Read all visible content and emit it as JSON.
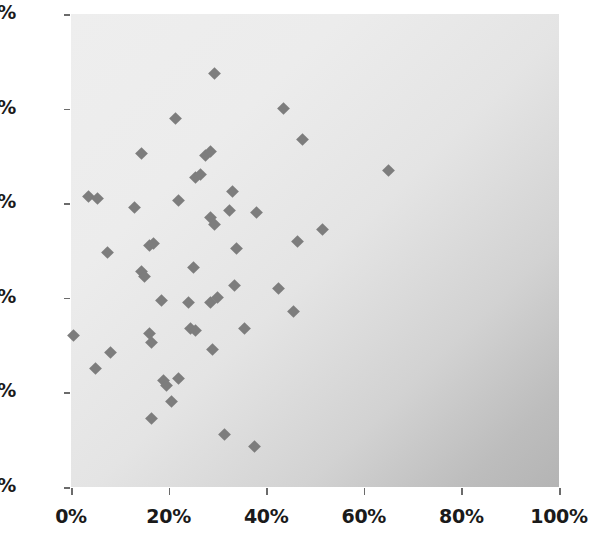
{
  "chart_data": {
    "type": "scatter",
    "title": "",
    "xlabel": "",
    "ylabel": "",
    "xlim": [
      0,
      100
    ],
    "ylim": [
      0,
      100
    ],
    "grid": false,
    "legend": null,
    "marker": {
      "shape": "diamond",
      "color": "#7d7d7d",
      "size_px": 9
    },
    "plot_background": {
      "type": "diagonal-gradient",
      "from": "#eeeeee",
      "to": "#b4b4b4",
      "direction": "top-left to bottom-right"
    },
    "xticks": [
      0,
      20,
      40,
      60,
      80,
      100
    ],
    "yticks": [
      0,
      20,
      40,
      60,
      80,
      100
    ],
    "xtick_labels": [
      "0%",
      "20%",
      "40%",
      "60%",
      "80%",
      "100%"
    ],
    "ytick_labels": [
      "0%",
      "20%",
      "40%",
      "60%",
      "80%",
      "100%"
    ],
    "units": "percent",
    "n_points": 51,
    "points": [
      {
        "x": 0.5,
        "y": 32.0
      },
      {
        "x": 3.5,
        "y": 61.5
      },
      {
        "x": 5.5,
        "y": 61.0
      },
      {
        "x": 5.0,
        "y": 25.0
      },
      {
        "x": 7.5,
        "y": 49.5
      },
      {
        "x": 8.0,
        "y": 28.5
      },
      {
        "x": 13.0,
        "y": 59.0
      },
      {
        "x": 14.5,
        "y": 70.5
      },
      {
        "x": 14.5,
        "y": 45.5
      },
      {
        "x": 15.0,
        "y": 44.5
      },
      {
        "x": 16.0,
        "y": 51.0
      },
      {
        "x": 17.0,
        "y": 51.5
      },
      {
        "x": 16.0,
        "y": 32.5
      },
      {
        "x": 16.5,
        "y": 30.5
      },
      {
        "x": 16.5,
        "y": 14.5
      },
      {
        "x": 18.5,
        "y": 39.5
      },
      {
        "x": 19.0,
        "y": 22.5
      },
      {
        "x": 19.5,
        "y": 21.5
      },
      {
        "x": 20.5,
        "y": 18.0
      },
      {
        "x": 21.5,
        "y": 78.0
      },
      {
        "x": 22.0,
        "y": 60.5
      },
      {
        "x": 22.0,
        "y": 23.0
      },
      {
        "x": 24.0,
        "y": 39.0
      },
      {
        "x": 24.5,
        "y": 33.5
      },
      {
        "x": 25.5,
        "y": 33.0
      },
      {
        "x": 25.5,
        "y": 65.5
      },
      {
        "x": 26.5,
        "y": 66.0
      },
      {
        "x": 27.5,
        "y": 70.0
      },
      {
        "x": 28.5,
        "y": 71.0
      },
      {
        "x": 28.5,
        "y": 57.0
      },
      {
        "x": 28.5,
        "y": 39.0
      },
      {
        "x": 29.5,
        "y": 55.5
      },
      {
        "x": 29.5,
        "y": 87.5
      },
      {
        "x": 29.0,
        "y": 29.0
      },
      {
        "x": 30.0,
        "y": 40.0
      },
      {
        "x": 31.5,
        "y": 11.0
      },
      {
        "x": 32.5,
        "y": 58.5
      },
      {
        "x": 33.0,
        "y": 62.5
      },
      {
        "x": 33.5,
        "y": 42.5
      },
      {
        "x": 34.0,
        "y": 50.5
      },
      {
        "x": 35.5,
        "y": 33.5
      },
      {
        "x": 37.5,
        "y": 8.5
      },
      {
        "x": 38.0,
        "y": 58.0
      },
      {
        "x": 42.5,
        "y": 42.0
      },
      {
        "x": 43.5,
        "y": 80.0
      },
      {
        "x": 45.5,
        "y": 37.0
      },
      {
        "x": 46.5,
        "y": 52.0
      },
      {
        "x": 47.5,
        "y": 73.5
      },
      {
        "x": 51.5,
        "y": 54.5
      },
      {
        "x": 65.0,
        "y": 67.0
      },
      {
        "x": 25.0,
        "y": 46.5
      }
    ]
  },
  "axes": {
    "x_ticks": [
      {
        "value": 0,
        "label": "0%"
      },
      {
        "value": 20,
        "label": "20%"
      },
      {
        "value": 40,
        "label": "40%"
      },
      {
        "value": 60,
        "label": "60%"
      },
      {
        "value": 80,
        "label": "80%"
      },
      {
        "value": 100,
        "label": "100%"
      }
    ],
    "y_ticks": [
      {
        "value": 0,
        "label": "0%"
      },
      {
        "value": 20,
        "label": "20%"
      },
      {
        "value": 40,
        "label": "40%"
      },
      {
        "value": 60,
        "label": "60%"
      },
      {
        "value": 80,
        "label": "80%"
      },
      {
        "value": 100,
        "label": "100%"
      }
    ]
  }
}
